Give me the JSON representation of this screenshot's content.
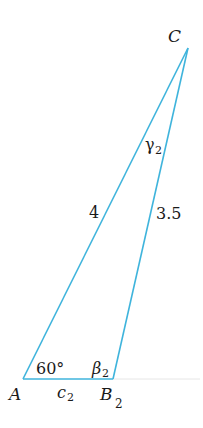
{
  "diagram": {
    "type": "triangle",
    "stroke_color": "#3fb4dc",
    "vertices": {
      "A": {
        "label": "A",
        "x": 23,
        "y": 379
      },
      "B": {
        "label": "B",
        "subscript": "2",
        "x": 113,
        "y": 379
      },
      "C": {
        "label": "C",
        "x": 188,
        "y": 48
      }
    },
    "sides": {
      "AC": {
        "label": "4"
      },
      "BC": {
        "label": "3.5"
      },
      "AB": {
        "label": "c",
        "subscript": "2"
      }
    },
    "angles": {
      "A": {
        "label": "60°"
      },
      "B": {
        "label": "β",
        "subscript": "2"
      },
      "C": {
        "label": "γ",
        "subscript": "2"
      }
    }
  }
}
